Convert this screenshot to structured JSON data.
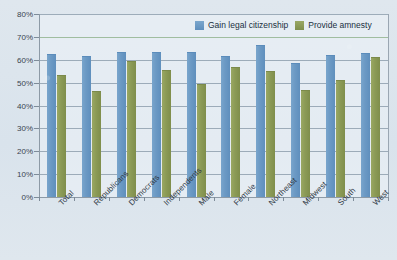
{
  "chart_data": {
    "type": "bar",
    "title": "",
    "xlabel": "",
    "ylabel": "",
    "ylim": [
      0,
      80
    ],
    "ytick_labels": [
      "0%",
      "10%",
      "20%",
      "30%",
      "40%",
      "50%",
      "60%",
      "70%",
      "80%"
    ],
    "ytick_values": [
      0,
      10,
      20,
      30,
      40,
      50,
      60,
      70,
      80
    ],
    "grid": true,
    "legend_position": "top-right-inside",
    "categories": [
      "Total",
      "Republicans",
      "Democrats",
      "Independents",
      "Male",
      "Female",
      "Northeast",
      "Midwest",
      "South",
      "West"
    ],
    "series": [
      {
        "name": "Gain legal citizenship",
        "color": "#6b99c4",
        "values": [
          62.5,
          61.5,
          63.5,
          63.5,
          63.5,
          61.5,
          66.5,
          58.5,
          62.0,
          63.0
        ]
      },
      {
        "name": "Provide amnesty",
        "color": "#8b9a56",
        "values": [
          53.5,
          46.5,
          59.5,
          55.5,
          49.5,
          57.0,
          55.0,
          47.0,
          51.0,
          61.0
        ]
      }
    ]
  },
  "legend": {
    "items": [
      {
        "label": "Gain legal citizenship",
        "swatch": "blue-swatch-icon"
      },
      {
        "label": "Provide amnesty",
        "swatch": "green-swatch-icon"
      }
    ]
  },
  "colors": {
    "series_blue": "#6b99c4",
    "series_green": "#8b9a56",
    "background": "#dde6ee",
    "gridline": "#8fa0ae",
    "axis": "#8d9aa6",
    "text": "#2f3945"
  }
}
